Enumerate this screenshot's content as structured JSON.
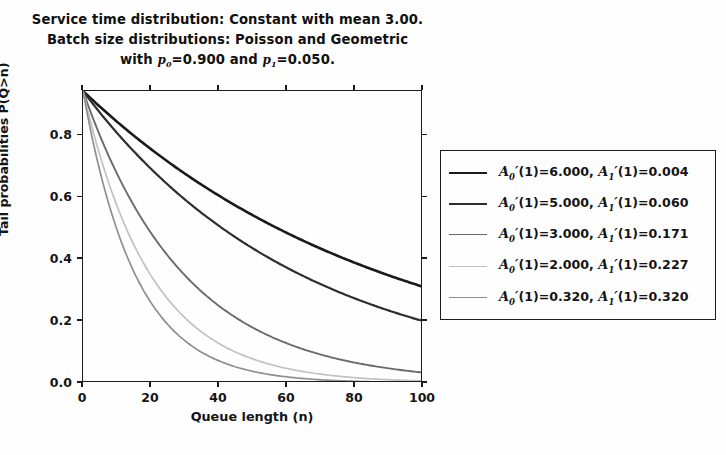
{
  "title": {
    "line1": "Service time distribution: Constant with mean 3.00.",
    "line2": "Batch size distributions: Poisson and Geometric",
    "line3_prefix": "with ",
    "line3_p0_sym": "p",
    "line3_p0_sub": "0",
    "line3_p0_val": "=0.900 and ",
    "line3_p1_sym": "p",
    "line3_p1_sub": "1",
    "line3_p1_val": "=0.050."
  },
  "axes": {
    "xlabel": "Queue length (n)",
    "ylabel": "Tail probabilities P(Q>n)",
    "xticks": [
      "0",
      "20",
      "40",
      "60",
      "80",
      "100"
    ],
    "yticks": [
      "0.0",
      "0.2",
      "0.4",
      "0.6",
      "0.8"
    ],
    "xlim": [
      0,
      100
    ],
    "ylim": [
      0.0,
      0.943
    ]
  },
  "legend": {
    "entries": [
      {
        "a0": "6.000",
        "a1": "0.004",
        "color": "#1a1a1a",
        "width": 2.6
      },
      {
        "a0": "5.000",
        "a1": "0.060",
        "color": "#2e2e2e",
        "width": 2.2
      },
      {
        "a0": "3.000",
        "a1": "0.171",
        "color": "#6b6b6b",
        "width": 1.9
      },
      {
        "a0": "2.000",
        "a1": "0.227",
        "color": "#c2c2c2",
        "width": 1.7
      },
      {
        "a0": "0.320",
        "a1": "0.320",
        "color": "#8f8f8f",
        "width": 1.7
      }
    ],
    "label_prefix_a0": "(1)=",
    "label_sep": ", ",
    "label_prefix_a1": "(1)=",
    "sym_a": "A",
    "sub0": "0",
    "sub1": "1",
    "prime": "′"
  },
  "chart_data": {
    "type": "line",
    "title": "Service time distribution: Constant with mean 3.00. Batch size distributions: Poisson and Geometric with p0=0.900 and p1=0.050.",
    "xlabel": "Queue length (n)",
    "ylabel": "Tail probabilities P(Q>n)",
    "xlim": [
      0,
      100
    ],
    "ylim": [
      0.0,
      0.943
    ],
    "xticks": [
      0,
      20,
      40,
      60,
      80,
      100
    ],
    "yticks": [
      0.0,
      0.2,
      0.4,
      0.6,
      0.8
    ],
    "grid": false,
    "legend_position": "right-outside",
    "x": [
      0,
      5,
      10,
      15,
      20,
      25,
      30,
      35,
      40,
      45,
      50,
      55,
      60,
      65,
      70,
      75,
      80,
      85,
      90,
      95,
      100
    ],
    "series": [
      {
        "name": "A0'(1)=6.000, A1'(1)=0.004",
        "color": "#1a1a1a",
        "linewidth": 2.6,
        "decay": 0.0111,
        "y0": 0.943,
        "values": [
          0.943,
          0.892,
          0.844,
          0.798,
          0.755,
          0.714,
          0.676,
          0.639,
          0.605,
          0.572,
          0.541,
          0.512,
          0.484,
          0.458,
          0.433,
          0.41,
          0.388,
          0.367,
          0.347,
          0.328,
          0.31
        ]
      },
      {
        "name": "A0'(1)=5.000, A1'(1)=0.060",
        "color": "#2e2e2e",
        "linewidth": 2.2,
        "decay": 0.0155,
        "y0": 0.943,
        "values": [
          0.943,
          0.873,
          0.808,
          0.747,
          0.692,
          0.64,
          0.592,
          0.548,
          0.507,
          0.469,
          0.434,
          0.402,
          0.372,
          0.344,
          0.318,
          0.295,
          0.273,
          0.252,
          0.234,
          0.216,
          0.2
        ]
      },
      {
        "name": "A0'(1)=3.000, A1'(1)=0.171",
        "color": "#6b6b6b",
        "linewidth": 1.9,
        "decay": 0.0333,
        "y0": 0.943,
        "values": [
          0.943,
          0.799,
          0.677,
          0.573,
          0.485,
          0.411,
          0.348,
          0.295,
          0.25,
          0.212,
          0.179,
          0.152,
          0.129,
          0.109,
          0.092,
          0.078,
          0.066,
          0.056,
          0.047,
          0.04,
          0.034
        ]
      },
      {
        "name": "A0'(1)=2.000, A1'(1)=0.227",
        "color": "#c2c2c2",
        "linewidth": 1.7,
        "decay": 0.05,
        "y0": 0.943,
        "values": [
          0.943,
          0.735,
          0.572,
          0.446,
          0.347,
          0.27,
          0.21,
          0.164,
          0.128,
          0.099,
          0.077,
          0.06,
          0.047,
          0.037,
          0.028,
          0.022,
          0.017,
          0.013,
          0.01,
          0.008,
          0.006
        ]
      },
      {
        "name": "A0'(1)=0.320, A1'(1)=0.320",
        "color": "#8f8f8f",
        "linewidth": 1.7,
        "decay": 0.0645,
        "y0": 0.943,
        "values": [
          0.943,
          0.683,
          0.495,
          0.359,
          0.26,
          0.188,
          0.136,
          0.099,
          0.072,
          0.052,
          0.038,
          0.027,
          0.02,
          0.014,
          0.01,
          0.007,
          0.005,
          0.004,
          0.003,
          0.002,
          0.002
        ]
      }
    ]
  }
}
